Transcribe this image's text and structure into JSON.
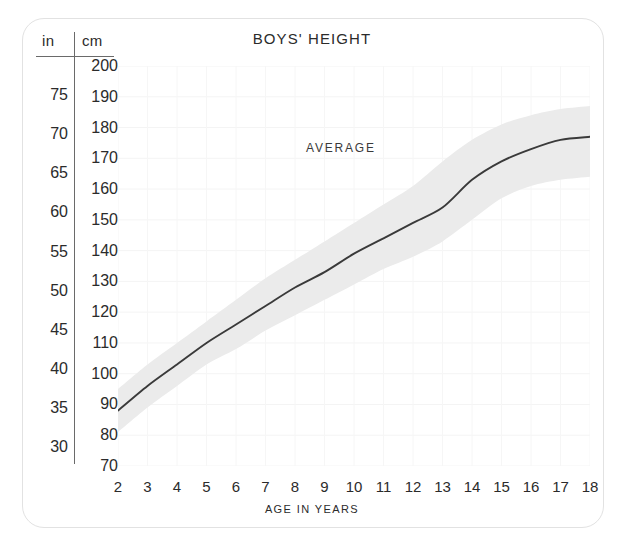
{
  "chart_data": {
    "type": "line",
    "title": "BOYS' HEIGHT",
    "xlabel": "AGE IN YEARS",
    "ylabel": "cm",
    "ylabel_secondary": "in",
    "annotation": "AVERAGE",
    "grid": true,
    "legend_position": "none",
    "xlim": [
      2,
      18
    ],
    "ylim": [
      70,
      200
    ],
    "x": [
      2,
      3,
      4,
      5,
      6,
      7,
      8,
      9,
      10,
      11,
      12,
      13,
      14,
      15,
      16,
      17,
      18
    ],
    "xticklabels": [
      "2",
      "3",
      "4",
      "5",
      "6",
      "7",
      "8",
      "9",
      "10",
      "11",
      "12",
      "13",
      "14",
      "15",
      "16",
      "17",
      "18"
    ],
    "yticks_cm": [
      200,
      190,
      180,
      170,
      160,
      150,
      140,
      130,
      120,
      110,
      100,
      90,
      80,
      70
    ],
    "yticklabels_cm": [
      "200",
      "190",
      "180",
      "170",
      "160",
      "170",
      "140",
      "130",
      "120",
      "110",
      "100",
      "90",
      "80",
      "70"
    ],
    "yticks_in": [
      75,
      70,
      65,
      60,
      55,
      50,
      45,
      40,
      35,
      30
    ],
    "yticklabels_in": [
      "75",
      "70",
      "65",
      "60",
      "55",
      "50",
      "45",
      "40",
      "35",
      "30"
    ],
    "series": [
      {
        "name": "AVERAGE",
        "units": "cm",
        "values": [
          88,
          96,
          103,
          110,
          116,
          122,
          128,
          133,
          139,
          144,
          149,
          154,
          163,
          169,
          173,
          176,
          177
        ]
      }
    ],
    "band": {
      "name": "normal range",
      "units": "cm",
      "upper": [
        95,
        103,
        110,
        117,
        124,
        131,
        137,
        143,
        149,
        155,
        161,
        169,
        176,
        181,
        184,
        186,
        187
      ],
      "lower": [
        81,
        89,
        96,
        103,
        108,
        114,
        119,
        124,
        129,
        134,
        138,
        143,
        150,
        157,
        161,
        163,
        164
      ]
    },
    "colors": {
      "line": "#3a3a3a",
      "band": "#eaeaea",
      "grid": "#f2f2f2",
      "text": "#2b2b2b",
      "card_border": "#e2e2e2",
      "background": "#ffffff"
    }
  },
  "axis_header": {
    "inches": "in",
    "centimeters": "cm"
  }
}
